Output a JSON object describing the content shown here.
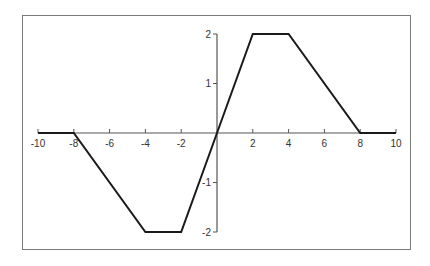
{
  "chart_data": {
    "type": "line",
    "title": "",
    "xlabel": "",
    "ylabel": "",
    "xlim": [
      -10,
      10
    ],
    "ylim": [
      -2,
      2
    ],
    "grid": false,
    "legend": null,
    "x_ticks": [
      -10,
      -8,
      -6,
      -4,
      -2,
      2,
      4,
      6,
      8,
      10
    ],
    "y_ticks": [
      -2,
      -1,
      1,
      2
    ],
    "x_tick_labels": [
      "-10",
      "-8",
      "-6",
      "-4",
      "-2",
      "2",
      "4",
      "6",
      "8",
      "10"
    ],
    "y_tick_labels": [
      "-2",
      "-1",
      "1",
      "2"
    ],
    "series": [
      {
        "name": "piecewise linear",
        "x": [
          -10,
          -8,
          -4,
          -2,
          0,
          2,
          4,
          8,
          10
        ],
        "y": [
          0,
          0,
          -2,
          -2,
          0,
          2,
          2,
          0,
          0
        ]
      }
    ]
  },
  "colors": {
    "line": "#1a1a1a",
    "axis": "#555555",
    "frame": "#7a7a7a"
  }
}
